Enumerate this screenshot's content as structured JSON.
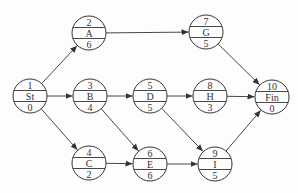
{
  "diagram": {
    "type": "activity-on-node network",
    "colors": {
      "stroke": "#333333",
      "text": "#333333",
      "background": "#fdfdfd"
    },
    "node_radius": 17,
    "nodes": [
      {
        "id": "St",
        "number": "1",
        "label": "St",
        "duration": "0",
        "x": 30,
        "y": 96
      },
      {
        "id": "A",
        "number": "2",
        "label": "A",
        "duration": "6",
        "x": 89,
        "y": 33
      },
      {
        "id": "B",
        "number": "3",
        "label": "B",
        "duration": "4",
        "x": 90,
        "y": 96
      },
      {
        "id": "C",
        "number": "4",
        "label": "C",
        "duration": "2",
        "x": 89,
        "y": 163
      },
      {
        "id": "D",
        "number": "5",
        "label": "D",
        "duration": "5",
        "x": 150,
        "y": 96
      },
      {
        "id": "E",
        "number": "6",
        "label": "E",
        "duration": "6",
        "x": 150,
        "y": 164
      },
      {
        "id": "G",
        "number": "7",
        "label": "G",
        "duration": "5",
        "x": 206,
        "y": 32
      },
      {
        "id": "H",
        "number": "8",
        "label": "H",
        "duration": "3",
        "x": 210,
        "y": 96
      },
      {
        "id": "I",
        "number": "9",
        "label": "I",
        "duration": "5",
        "x": 215,
        "y": 164
      },
      {
        "id": "Fin",
        "number": "10",
        "label": "Fin",
        "duration": "0",
        "x": 272,
        "y": 97
      }
    ],
    "edges": [
      {
        "from": "St",
        "to": "A"
      },
      {
        "from": "St",
        "to": "B"
      },
      {
        "from": "St",
        "to": "C"
      },
      {
        "from": "A",
        "to": "G"
      },
      {
        "from": "B",
        "to": "D"
      },
      {
        "from": "B",
        "to": "E"
      },
      {
        "from": "C",
        "to": "E"
      },
      {
        "from": "D",
        "to": "H"
      },
      {
        "from": "D",
        "to": "I"
      },
      {
        "from": "E",
        "to": "I"
      },
      {
        "from": "G",
        "to": "Fin"
      },
      {
        "from": "H",
        "to": "Fin"
      },
      {
        "from": "I",
        "to": "Fin"
      }
    ]
  }
}
